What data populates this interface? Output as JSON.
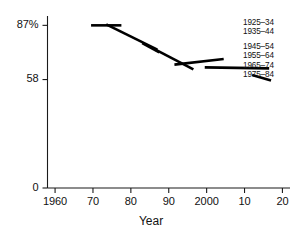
{
  "chart_data": {
    "type": "line",
    "title": "",
    "subtitle": "",
    "xlabel": "Year",
    "ylabel": "",
    "xlim": [
      1958,
      2022
    ],
    "ylim": [
      0,
      92
    ],
    "grid": false,
    "legend_position": "right",
    "x_ticks": [
      {
        "value": 1960,
        "label": "1960"
      },
      {
        "value": 1970,
        "label": "70"
      },
      {
        "value": 1980,
        "label": "80"
      },
      {
        "value": 1990,
        "label": "90"
      },
      {
        "value": 2000,
        "label": "2000"
      },
      {
        "value": 2010,
        "label": "10"
      },
      {
        "value": 2020,
        "label": "20"
      }
    ],
    "y_ticks": [
      {
        "value": 0,
        "label": "0"
      },
      {
        "value": 58,
        "label": "58"
      },
      {
        "value": 87,
        "label": "87%"
      }
    ],
    "series": [
      {
        "name": "1925–34",
        "x": [
          1969.5,
          1977.5
        ],
        "values": [
          87.0,
          87.0
        ]
      },
      {
        "name": "1935–44",
        "x": [
          1973.5,
          1987.0
        ],
        "values": [
          87.5,
          74.0
        ]
      },
      {
        "name": "1945–54",
        "x": [
          1983.0,
          1987.5
        ],
        "values": [
          77.5,
          72.5
        ]
      },
      {
        "name": "1955–64",
        "x": [
          1986.5,
          1996.5
        ],
        "values": [
          74.0,
          63.5
        ]
      },
      {
        "name": "1955–64b",
        "x": [
          1991.5,
          2004.5
        ],
        "values": [
          66.0,
          69.0
        ]
      },
      {
        "name": "1965–74",
        "x": [
          1999.5,
          2016.5
        ],
        "values": [
          64.5,
          64.0
        ]
      },
      {
        "name": "1975–84",
        "x": [
          2012.0,
          2017.0
        ],
        "values": [
          60.5,
          57.5
        ]
      }
    ],
    "legend_entries": [
      "1925–34",
      "1935–44",
      "1945–54",
      "1955–64",
      "1965–74",
      "1975–84"
    ]
  },
  "axis": {
    "x_title": "Year"
  },
  "colors": {
    "line": "#000000",
    "axis": "#1a1a1a",
    "background": "#ffffff",
    "text": "#111111"
  }
}
